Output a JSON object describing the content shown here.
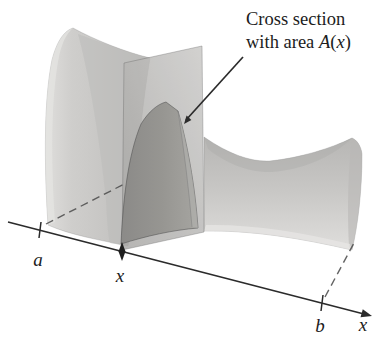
{
  "figure": {
    "annotation": {
      "line1": "Cross section",
      "line2_prefix": "with area ",
      "area_function": "A",
      "paren_open": "(",
      "variable": "x",
      "paren_close": ")"
    },
    "axis": {
      "axis_label": "x",
      "tick_a": "a",
      "tick_x": "x",
      "tick_b": "b"
    },
    "colors": {
      "background": "#ffffff",
      "solid_surface": "#c8c7c5",
      "cutting_plane": "#b3b2b0",
      "cross_section_face": "#95948f",
      "line": "#2b2b2b"
    }
  }
}
